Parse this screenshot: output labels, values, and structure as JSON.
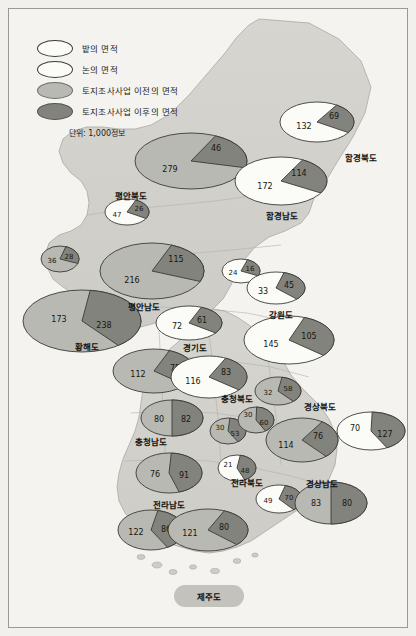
{
  "legend": {
    "items": [
      {
        "key": "bat",
        "swatch": "white-ellipse",
        "label": "밭의 면적"
      },
      {
        "key": "non",
        "swatch": "white-ellipse",
        "label": "논의 면적"
      },
      {
        "key": "before",
        "swatch": "light-gray-ellipse",
        "label": "토지조사사업 이전의 면적"
      },
      {
        "key": "after",
        "swatch": "dark-gray-ellipse",
        "label": "토지조사사업 이후의 면적"
      }
    ],
    "unit": "단위: 1,000정보"
  },
  "colors": {
    "light": "#b9b9b4",
    "dark": "#83837d",
    "white": "#fbfbf8",
    "outline": "#3a3a38",
    "land": "#d2d1cb",
    "sea": "#f4f3ef",
    "text": "#17170f"
  },
  "provinces": [
    {
      "name": "평안북도",
      "x": 122,
      "y": 186
    },
    {
      "name": "함경북도",
      "x": 352,
      "y": 148
    },
    {
      "name": "함경남도",
      "x": 273,
      "y": 206
    },
    {
      "name": "평안남도",
      "x": 135,
      "y": 297
    },
    {
      "name": "황해도",
      "x": 78,
      "y": 337
    },
    {
      "name": "강원도",
      "x": 272,
      "y": 305
    },
    {
      "name": "경기도",
      "x": 186,
      "y": 338
    },
    {
      "name": "충청북도",
      "x": 228,
      "y": 389
    },
    {
      "name": "경상북도",
      "x": 311,
      "y": 397
    },
    {
      "name": "충청남도",
      "x": 142,
      "y": 432
    },
    {
      "name": "전라북도",
      "x": 238,
      "y": 473
    },
    {
      "name": "경상남도",
      "x": 313,
      "y": 474
    },
    {
      "name": "전라남도",
      "x": 160,
      "y": 495
    },
    {
      "name": "제주도",
      "x": 200,
      "y": 587
    }
  ],
  "chart_data": {
    "type": "pie",
    "unit": "1,000정보",
    "legend": [
      "밭의 면적",
      "논의 면적",
      "토지조사사업 이전의 면적",
      "토지조사사업 이후의 면적"
    ],
    "charts": [
      {
        "id": "pyonganbuk-big",
        "province": "평안북도",
        "cx": 182,
        "cy": 152,
        "rx": 56,
        "ry": 28,
        "slices": [
          {
            "value": 279,
            "fill": "light",
            "lx": 161,
            "ly": 160
          },
          {
            "value": 46,
            "fill": "dark",
            "lx": 207,
            "ly": 139
          }
        ],
        "split_start": -64,
        "split_end": 14
      },
      {
        "id": "pyonganbuk-small",
        "province": "평안북도",
        "cx": 118,
        "cy": 203,
        "rx": 22,
        "ry": 13,
        "slices": [
          {
            "value": 47,
            "fill": "white",
            "lx": 108,
            "ly": 206
          },
          {
            "value": 26,
            "fill": "dark",
            "lx": 130,
            "ly": 200
          }
        ],
        "split_start": -66,
        "split_end": 30
      },
      {
        "id": "hamgyongbuk",
        "province": "함경북도",
        "cx": 308,
        "cy": 113,
        "rx": 37,
        "ry": 20,
        "slices": [
          {
            "value": 132,
            "fill": "white",
            "lx": 295,
            "ly": 117
          },
          {
            "value": 69,
            "fill": "dark",
            "lx": 325,
            "ly": 107
          }
        ],
        "split_start": -58,
        "split_end": 32
      },
      {
        "id": "hamgyongnam",
        "province": "함경남도",
        "cx": 272,
        "cy": 172,
        "rx": 46,
        "ry": 24,
        "slices": [
          {
            "value": 172,
            "fill": "white",
            "lx": 256,
            "ly": 177
          },
          {
            "value": 114,
            "fill": "dark",
            "lx": 290,
            "ly": 164
          }
        ],
        "split_start": -62,
        "split_end": 30
      },
      {
        "id": "pyongannam-big",
        "province": "평안남도",
        "cx": 143,
        "cy": 262,
        "rx": 52,
        "ry": 28,
        "slices": [
          {
            "value": 216,
            "fill": "light",
            "lx": 123,
            "ly": 271
          },
          {
            "value": 115,
            "fill": "dark",
            "lx": 167,
            "ly": 250
          }
        ],
        "split_start": -68,
        "split_end": 22
      },
      {
        "id": "pyongannam-small",
        "province": "평안남도",
        "cx": 51,
        "cy": 250,
        "rx": 19,
        "ry": 13,
        "slices": [
          {
            "value": 36,
            "fill": "light",
            "lx": 43,
            "ly": 252
          },
          {
            "value": 28,
            "fill": "dark",
            "lx": 60,
            "ly": 248
          }
        ],
        "split_start": -72,
        "split_end": 20
      },
      {
        "id": "hwanghae",
        "province": "황해도",
        "cx": 73,
        "cy": 312,
        "rx": 59,
        "ry": 31,
        "slices": [
          {
            "value": 173,
            "fill": "light",
            "lx": 50,
            "ly": 310
          },
          {
            "value": 238,
            "fill": "dark",
            "lx": 95,
            "ly": 316
          }
        ],
        "split_start": -82,
        "split_end": 52
      },
      {
        "id": "gangwon-small",
        "province": "강원도",
        "cx": 232,
        "cy": 262,
        "rx": 19,
        "ry": 12,
        "slices": [
          {
            "value": 24,
            "fill": "white",
            "lx": 224,
            "ly": 264
          },
          {
            "value": 16,
            "fill": "dark",
            "lx": 241,
            "ly": 260
          }
        ],
        "split_start": -70,
        "split_end": 24
      },
      {
        "id": "gangwon-mid",
        "province": "강원도",
        "cx": 267,
        "cy": 279,
        "rx": 29,
        "ry": 16,
        "slices": [
          {
            "value": 33,
            "fill": "white",
            "lx": 254,
            "ly": 282
          },
          {
            "value": 45,
            "fill": "dark",
            "lx": 280,
            "ly": 276
          }
        ],
        "split_start": -74,
        "split_end": 44
      },
      {
        "id": "gangwon-big",
        "province": "강원도",
        "cx": 280,
        "cy": 331,
        "rx": 45,
        "ry": 24,
        "slices": [
          {
            "value": 145,
            "fill": "white",
            "lx": 262,
            "ly": 335
          },
          {
            "value": 105,
            "fill": "dark",
            "lx": 300,
            "ly": 327
          }
        ],
        "split_start": -70,
        "split_end": 40
      },
      {
        "id": "gyeonggi-top",
        "province": "경기도",
        "cx": 180,
        "cy": 314,
        "rx": 33,
        "ry": 17,
        "slices": [
          {
            "value": 72,
            "fill": "white",
            "lx": 168,
            "ly": 317
          },
          {
            "value": 61,
            "fill": "dark",
            "lx": 193,
            "ly": 311
          }
        ],
        "split_start": -68,
        "split_end": 36
      },
      {
        "id": "gyeonggi-left",
        "province": "경기도",
        "cx": 145,
        "cy": 362,
        "rx": 41,
        "ry": 22,
        "slices": [
          {
            "value": 112,
            "fill": "light",
            "lx": 129,
            "ly": 365
          },
          {
            "value": 75,
            "fill": "dark",
            "lx": 166,
            "ly": 359
          }
        ],
        "split_start": -68,
        "split_end": 40
      },
      {
        "id": "gyeonggi-mid",
        "province": "경기도",
        "cx": 200,
        "cy": 368,
        "rx": 38,
        "ry": 21,
        "slices": [
          {
            "value": 116,
            "fill": "white",
            "lx": 184,
            "ly": 372
          },
          {
            "value": 83,
            "fill": "dark",
            "lx": 217,
            "ly": 363
          }
        ],
        "split_start": -64,
        "split_end": 38
      },
      {
        "id": "chungbuk",
        "province": "충청북도",
        "cx": 269,
        "cy": 382,
        "rx": 23,
        "ry": 14,
        "slices": [
          {
            "value": 32,
            "fill": "light",
            "lx": 259,
            "ly": 384
          },
          {
            "value": 58,
            "fill": "dark",
            "lx": 279,
            "ly": 380
          }
        ],
        "split_start": -80,
        "split_end": 48
      },
      {
        "id": "gyeongbuk-mid",
        "province": "경상북도",
        "cx": 293,
        "cy": 431,
        "rx": 36,
        "ry": 22,
        "slices": [
          {
            "value": 114,
            "fill": "light",
            "lx": 277,
            "ly": 436
          },
          {
            "value": 76,
            "fill": "dark",
            "lx": 309,
            "ly": 427
          }
        ],
        "split_start": -56,
        "split_end": 48
      },
      {
        "id": "gyeongbuk-right",
        "province": "경상북도",
        "cx": 362,
        "cy": 422,
        "rx": 34,
        "ry": 19,
        "slices": [
          {
            "value": 70,
            "fill": "white",
            "lx": 346,
            "ly": 419
          },
          {
            "value": 127,
            "fill": "dark",
            "lx": 376,
            "ly": 425
          }
        ],
        "split_start": -88,
        "split_end": 62
      },
      {
        "id": "chungnam-top",
        "province": "충청남도",
        "cx": 163,
        "cy": 409,
        "rx": 31,
        "ry": 18,
        "slices": [
          {
            "value": 80,
            "fill": "light",
            "lx": 150,
            "ly": 410
          },
          {
            "value": 82,
            "fill": "dark",
            "lx": 177,
            "ly": 410
          }
        ],
        "split_start": -90,
        "split_end": 90
      },
      {
        "id": "chungnam-bot",
        "province": "충청남도",
        "cx": 160,
        "cy": 464,
        "rx": 33,
        "ry": 20,
        "slices": [
          {
            "value": 76,
            "fill": "light",
            "lx": 146,
            "ly": 465
          },
          {
            "value": 91,
            "fill": "dark",
            "lx": 175,
            "ly": 466
          }
        ],
        "split_start": -86,
        "split_end": 72
      },
      {
        "id": "small-30-53",
        "province": "충청남도",
        "cx": 219,
        "cy": 422,
        "rx": 18,
        "ry": 13,
        "slices": [
          {
            "value": 30,
            "fill": "light",
            "lx": 211,
            "ly": 419
          },
          {
            "value": 53,
            "fill": "dark",
            "lx": 226,
            "ly": 425
          }
        ],
        "split_start": -84,
        "split_end": 56
      },
      {
        "id": "small-30-60",
        "province": "충청북도",
        "cx": 247,
        "cy": 411,
        "rx": 18,
        "ry": 13,
        "slices": [
          {
            "value": 30,
            "fill": "light",
            "lx": 239,
            "ly": 406
          },
          {
            "value": 60,
            "fill": "dark",
            "lx": 255,
            "ly": 414
          }
        ],
        "split_start": -88,
        "split_end": 58
      },
      {
        "id": "jeonbuk-small",
        "province": "전라북도",
        "cx": 228,
        "cy": 459,
        "rx": 19,
        "ry": 13,
        "slices": [
          {
            "value": 21,
            "fill": "white",
            "lx": 219,
            "ly": 456
          },
          {
            "value": 48,
            "fill": "dark",
            "lx": 236,
            "ly": 462
          }
        ],
        "split_start": -80,
        "split_end": 66
      },
      {
        "id": "gyeongnam-small",
        "province": "경상남도",
        "cx": 270,
        "cy": 490,
        "rx": 23,
        "ry": 14,
        "slices": [
          {
            "value": 49,
            "fill": "white",
            "lx": 259,
            "ly": 492
          },
          {
            "value": 70,
            "fill": "dark",
            "lx": 280,
            "ly": 489
          }
        ],
        "split_start": -74,
        "split_end": 50
      },
      {
        "id": "gyeongnam-big",
        "province": "경상남도",
        "cx": 322,
        "cy": 494,
        "rx": 36,
        "ry": 21,
        "slices": [
          {
            "value": 83,
            "fill": "light",
            "lx": 307,
            "ly": 494
          },
          {
            "value": 80,
            "fill": "dark",
            "lx": 338,
            "ly": 494
          }
        ],
        "split_start": -90,
        "split_end": 90
      },
      {
        "id": "jeonnam-left",
        "province": "전라남도",
        "cx": 142,
        "cy": 521,
        "rx": 33,
        "ry": 20,
        "slices": [
          {
            "value": 122,
            "fill": "light",
            "lx": 127,
            "ly": 523
          },
          {
            "value": 86,
            "fill": "dark",
            "lx": 157,
            "ly": 520
          }
        ],
        "split_start": -78,
        "split_end": 60
      },
      {
        "id": "jeonnam-right",
        "province": "전라남도",
        "cx": 199,
        "cy": 521,
        "rx": 40,
        "ry": 21,
        "slices": [
          {
            "value": 121,
            "fill": "light",
            "lx": 181,
            "ly": 524
          },
          {
            "value": 80,
            "fill": "dark",
            "lx": 215,
            "ly": 518
          }
        ],
        "split_start": -66,
        "split_end": 44
      }
    ]
  }
}
